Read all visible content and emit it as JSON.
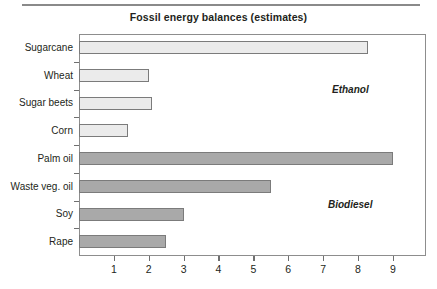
{
  "chart_data": {
    "type": "bar",
    "orientation": "horizontal",
    "title": "Fossil energy balances (estimates)",
    "xlabel": "",
    "ylabel": "",
    "categories": [
      "Sugarcane",
      "Wheat",
      "Sugar beets",
      "Corn",
      "Palm oil",
      "Waste veg. oil",
      "Soy",
      "Rape"
    ],
    "values": [
      8.3,
      2.0,
      2.1,
      1.4,
      9.0,
      5.5,
      3.0,
      2.5
    ],
    "groups": [
      "Ethanol",
      "Ethanol",
      "Ethanol",
      "Ethanol",
      "Biodiesel",
      "Biodiesel",
      "Biodiesel",
      "Biodiesel"
    ],
    "xlim": [
      0,
      9.95
    ],
    "xticks": [
      1,
      2,
      3,
      4,
      5,
      6,
      7,
      8,
      9
    ],
    "xticklabels": [
      "1",
      "2",
      "3",
      "4",
      "5",
      "6",
      "7",
      "8",
      "9"
    ],
    "grid": false,
    "legend": "none",
    "annotations": [
      {
        "text": "Ethanol",
        "group": "Ethanol"
      },
      {
        "text": "Biodiesel",
        "group": "Biodiesel"
      }
    ],
    "colors": {
      "ethanol_fill": "#ebebeb",
      "biodiesel_fill": "#a9a9a9",
      "bar_border": "#7b7b7b",
      "frame": "#8d8d8d",
      "text": "#231f20",
      "rule": "#8a8a8a"
    }
  }
}
